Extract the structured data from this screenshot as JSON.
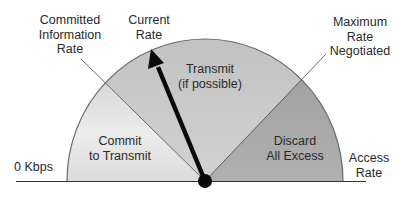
{
  "diagram": {
    "type": "rate-gauge",
    "labels": {
      "committed_information_rate": "Committed\nInformation\nRate",
      "current_rate": "Current\nRate",
      "maximum_rate_negotiated": "Maximum\nRate\nNegotiated",
      "zero_kbps": "0 Kbps",
      "access_rate": "Access\nRate"
    },
    "zones": [
      {
        "id": "commit",
        "label": "Commit\nto Transmit",
        "color": "#e3e3e3"
      },
      {
        "id": "transmit",
        "label": "Transmit\n(if possible)",
        "color": "#c9c9c9"
      },
      {
        "id": "discard",
        "label": "Discard\nAll Excess",
        "color": "#a8a8a8"
      }
    ],
    "colors": {
      "outline": "#6a6a6a",
      "needle": "#0a0a0a",
      "baseline": "#333333",
      "text": "#2a2a2a"
    }
  }
}
